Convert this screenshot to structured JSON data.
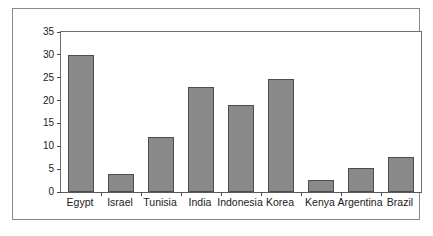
{
  "chart_data": {
    "type": "bar",
    "title": "",
    "subtitle": "",
    "xlabel": "",
    "ylabel": "",
    "categories": [
      "Egypt",
      "Israel",
      "Tunisia",
      "India",
      "Indonesia",
      "Korea",
      "Kenya",
      "Argentina",
      "Brazil"
    ],
    "values": [
      30,
      4,
      12,
      23,
      19,
      24.7,
      2.6,
      5.2,
      7.7
    ],
    "ylim": [
      0,
      35
    ],
    "yticks": [
      0,
      5,
      10,
      15,
      20,
      25,
      30,
      35
    ],
    "ytick_labels": [
      "0",
      "5",
      "10",
      "15",
      "20",
      "25",
      "30",
      "35"
    ],
    "grid": false,
    "legend": null,
    "bar_color": "#898989",
    "bar_edge_color": "#4d4d4d",
    "axis_color": "#6e6e6e",
    "frame_color": "#8a8a8a",
    "background_color": "#ffffff",
    "text_color": "#1a1a1a"
  }
}
